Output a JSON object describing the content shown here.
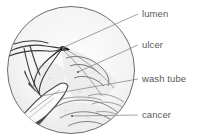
{
  "figure": {
    "kind": "endoscopic-illustration",
    "viewport_shape": "circle",
    "background_color": "#ffffff",
    "line_color": "#4a4a4a",
    "label_color": "#58585a",
    "fill_color": "#f2f2f2"
  },
  "labels": [
    {
      "id": "lumen",
      "text": "lumen",
      "anchor_x": 62,
      "anchor_y": 48,
      "leader_to_x": 138,
      "leader_to_y": 14
    },
    {
      "id": "ulcer",
      "text": "ulcer",
      "anchor_x": 78,
      "anchor_y": 72,
      "leader_to_x": 138,
      "leader_to_y": 45
    },
    {
      "id": "washtube",
      "text": "wash tube",
      "anchor_x": 41,
      "anchor_y": 96,
      "leader_to_x": 138,
      "leader_to_y": 79
    },
    {
      "id": "cancer",
      "text": "cancer",
      "anchor_x": 72,
      "anchor_y": 116,
      "leader_to_x": 138,
      "leader_to_y": 115
    }
  ],
  "circle": {
    "cx": 71,
    "cy": 70,
    "r": 64
  }
}
